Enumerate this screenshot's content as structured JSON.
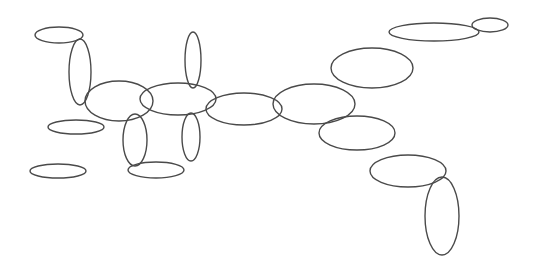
{
  "diagram": {
    "background": "#ffffff",
    "stroke_color": "#4a4a4a",
    "width": 537,
    "height": 262,
    "shapes": [
      {
        "type": "ellipse",
        "cx": 59,
        "cy": 35,
        "rx": 24,
        "ry": 8
      },
      {
        "type": "ellipse",
        "cx": 80,
        "cy": 72,
        "rx": 11,
        "ry": 33
      },
      {
        "type": "ellipse",
        "cx": 119,
        "cy": 101,
        "rx": 34,
        "ry": 20
      },
      {
        "type": "ellipse",
        "cx": 193,
        "cy": 60,
        "rx": 8,
        "ry": 28
      },
      {
        "type": "ellipse",
        "cx": 178,
        "cy": 99,
        "rx": 38,
        "ry": 16
      },
      {
        "type": "ellipse",
        "cx": 76,
        "cy": 127,
        "rx": 28,
        "ry": 7
      },
      {
        "type": "ellipse",
        "cx": 135,
        "cy": 140,
        "rx": 12,
        "ry": 26
      },
      {
        "type": "ellipse",
        "cx": 191,
        "cy": 137,
        "rx": 9,
        "ry": 24
      },
      {
        "type": "ellipse",
        "cx": 58,
        "cy": 171,
        "rx": 28,
        "ry": 7
      },
      {
        "type": "ellipse",
        "cx": 156,
        "cy": 170,
        "rx": 28,
        "ry": 8
      },
      {
        "type": "ellipse",
        "cx": 244,
        "cy": 109,
        "rx": 38,
        "ry": 16
      },
      {
        "type": "ellipse",
        "cx": 314,
        "cy": 104,
        "rx": 41,
        "ry": 20
      },
      {
        "type": "ellipse",
        "cx": 372,
        "cy": 68,
        "rx": 41,
        "ry": 20
      },
      {
        "type": "ellipse",
        "cx": 357,
        "cy": 133,
        "rx": 38,
        "ry": 17
      },
      {
        "type": "ellipse",
        "cx": 434,
        "cy": 32,
        "rx": 45,
        "ry": 9
      },
      {
        "type": "ellipse",
        "cx": 490,
        "cy": 25,
        "rx": 18,
        "ry": 7
      },
      {
        "type": "ellipse",
        "cx": 408,
        "cy": 171,
        "rx": 38,
        "ry": 16
      },
      {
        "type": "ellipse",
        "cx": 442,
        "cy": 216,
        "rx": 17,
        "ry": 39
      }
    ]
  }
}
